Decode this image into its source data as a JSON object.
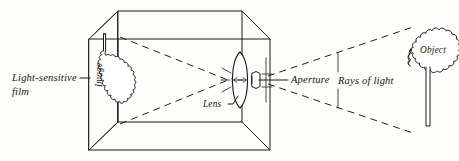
{
  "figure": {
    "type": "optics-diagram",
    "background_color": "#fdfdfb",
    "ink_color": "#1c1a17"
  },
  "labels": {
    "film": {
      "line1": "Light-sensitive",
      "line2": "film"
    },
    "image": "Image",
    "lens": "Lens",
    "aperture": "Aperture",
    "rays": "Rays of light",
    "object": "Object"
  },
  "elements": {
    "camera_box": "wireframe-rectangular-box",
    "film_plane": "vertical-rectangle-at-left-end-of-box",
    "image_shape": "inverted-tree-silhouette-on-film",
    "lens_shape": "biconvex-lens-ellipse",
    "aperture_shape": "small-diaphragm-behind-lens",
    "object_shape": "upright-tree-silhouette",
    "ray_lines": "four-dashed-lines-crossing-at-lens"
  },
  "colors": {
    "ink": "#1c1a17",
    "paper": "#fdfdfb",
    "dash": "#222020"
  }
}
